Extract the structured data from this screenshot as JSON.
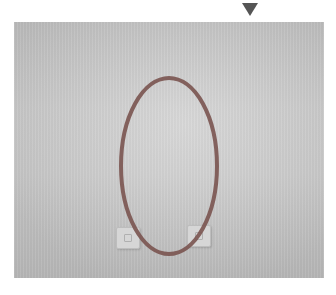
{
  "image": {
    "description": "Photograph of a plain light-gray wall with two small wall outlets near the bottom, annotated with a red-brown ellipse",
    "marker": {
      "shape": "triangle-down",
      "color": "#555555"
    },
    "annotation": {
      "shape": "ellipse",
      "color": "#7a5450",
      "cx": 169,
      "cy": 166,
      "rx": 48,
      "ry": 88,
      "stroke_width": 4
    },
    "objects": [
      {
        "name": "wall-outlet-left"
      },
      {
        "name": "wall-outlet-right"
      }
    ]
  }
}
